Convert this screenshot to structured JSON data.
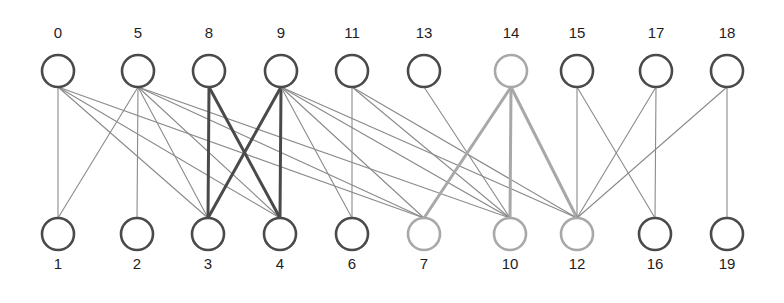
{
  "diagram": {
    "type": "bipartite-graph",
    "colors": {
      "dark": "#4a4a4a",
      "light": "#a8a8a8",
      "edge_thin": "#8a8a8a",
      "edge_thick_dark": "#4a4a4a",
      "edge_thick_light": "#a8a8a8"
    },
    "top_nodes": [
      {
        "id": "0",
        "x": 58,
        "style": "dark"
      },
      {
        "id": "5",
        "x": 138,
        "style": "dark"
      },
      {
        "id": "8",
        "x": 209,
        "style": "dark"
      },
      {
        "id": "9",
        "x": 281,
        "style": "dark"
      },
      {
        "id": "11",
        "x": 352,
        "style": "dark"
      },
      {
        "id": "13",
        "x": 424,
        "style": "dark"
      },
      {
        "id": "14",
        "x": 511,
        "style": "light"
      },
      {
        "id": "15",
        "x": 577,
        "style": "dark"
      },
      {
        "id": "17",
        "x": 656,
        "style": "dark"
      },
      {
        "id": "18",
        "x": 727,
        "style": "dark"
      }
    ],
    "bottom_nodes": [
      {
        "id": "1",
        "x": 58,
        "style": "dark"
      },
      {
        "id": "2",
        "x": 137,
        "style": "dark"
      },
      {
        "id": "3",
        "x": 208,
        "style": "dark"
      },
      {
        "id": "4",
        "x": 280,
        "style": "dark"
      },
      {
        "id": "6",
        "x": 352,
        "style": "dark"
      },
      {
        "id": "7",
        "x": 424,
        "style": "light"
      },
      {
        "id": "10",
        "x": 510,
        "style": "light"
      },
      {
        "id": "12",
        "x": 577,
        "style": "light"
      },
      {
        "id": "16",
        "x": 655,
        "style": "dark"
      },
      {
        "id": "19",
        "x": 727,
        "style": "dark"
      }
    ],
    "edges": [
      {
        "from": "0",
        "to": "1",
        "style": "thin"
      },
      {
        "from": "0",
        "to": "3",
        "style": "thin"
      },
      {
        "from": "0",
        "to": "4",
        "style": "thin"
      },
      {
        "from": "0",
        "to": "7",
        "style": "thin"
      },
      {
        "from": "5",
        "to": "1",
        "style": "thin"
      },
      {
        "from": "5",
        "to": "2",
        "style": "thin"
      },
      {
        "from": "5",
        "to": "3",
        "style": "thin"
      },
      {
        "from": "5",
        "to": "4",
        "style": "thin"
      },
      {
        "from": "5",
        "to": "7",
        "style": "thin"
      },
      {
        "from": "5",
        "to": "10",
        "style": "thin"
      },
      {
        "from": "8",
        "to": "3",
        "style": "thick-dark"
      },
      {
        "from": "8",
        "to": "4",
        "style": "thick-dark"
      },
      {
        "from": "9",
        "to": "3",
        "style": "thick-dark"
      },
      {
        "from": "9",
        "to": "4",
        "style": "thick-dark"
      },
      {
        "from": "9",
        "to": "6",
        "style": "thin"
      },
      {
        "from": "9",
        "to": "7",
        "style": "thin"
      },
      {
        "from": "9",
        "to": "10",
        "style": "thin"
      },
      {
        "from": "9",
        "to": "12",
        "style": "thin"
      },
      {
        "from": "11",
        "to": "6",
        "style": "thin"
      },
      {
        "from": "11",
        "to": "10",
        "style": "thin"
      },
      {
        "from": "11",
        "to": "12",
        "style": "thin"
      },
      {
        "from": "13",
        "to": "10",
        "style": "thin"
      },
      {
        "from": "14",
        "to": "7",
        "style": "thick-light"
      },
      {
        "from": "14",
        "to": "10",
        "style": "thick-light"
      },
      {
        "from": "14",
        "to": "12",
        "style": "thick-light"
      },
      {
        "from": "15",
        "to": "12",
        "style": "thin"
      },
      {
        "from": "15",
        "to": "16",
        "style": "thin"
      },
      {
        "from": "17",
        "to": "12",
        "style": "thin"
      },
      {
        "from": "17",
        "to": "16",
        "style": "thin"
      },
      {
        "from": "18",
        "to": "12",
        "style": "thin"
      },
      {
        "from": "18",
        "to": "19",
        "style": "thin"
      }
    ],
    "layout": {
      "top_label_y": 33,
      "top_node_cy": 71,
      "bottom_node_cy": 234,
      "bottom_label_y": 264,
      "radius": 16
    }
  }
}
